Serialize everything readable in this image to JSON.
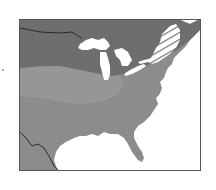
{
  "map": {
    "region": "Eastern United States",
    "style": "grayscale shaded zones",
    "zones": [
      {
        "name": "northern-zone",
        "shade": "dark",
        "color": "#6e6e6e"
      },
      {
        "name": "southern-zone",
        "shade": "medium",
        "color": "#8c8c8c"
      },
      {
        "name": "central-light-zone",
        "shade": "light",
        "color": "#979797"
      },
      {
        "name": "northeast-hatched-zone",
        "shade": "hatched",
        "color": "#ffffff"
      }
    ],
    "water_color": "#ffffff",
    "border_color": "#2a2a2a",
    "frame_color": "#555555",
    "labels": []
  }
}
